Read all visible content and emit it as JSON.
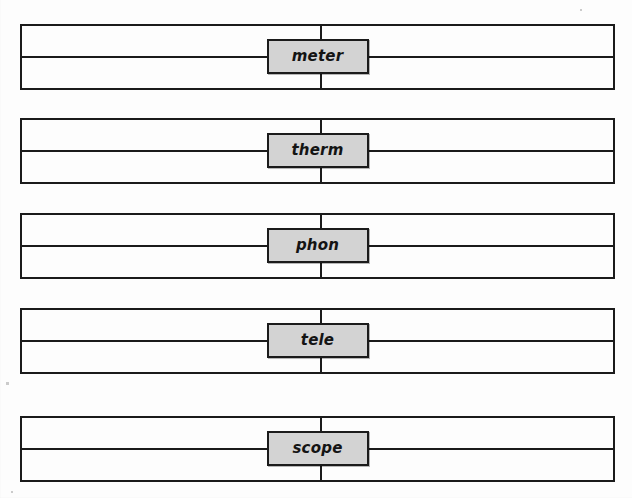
{
  "figure": {
    "type": "morpheme-diagram",
    "background_color": "#fdfdfd",
    "line_color": "#1b1b1b",
    "chip_fill_color": "#d3d3d3",
    "chip_text_color": "#141414",
    "rows": [
      {
        "label": "meter",
        "top": 24
      },
      {
        "label": "therm",
        "top": 118
      },
      {
        "label": "phon",
        "top": 213
      },
      {
        "label": "tele",
        "top": 308
      },
      {
        "label": "scope",
        "top": 416
      }
    ]
  }
}
